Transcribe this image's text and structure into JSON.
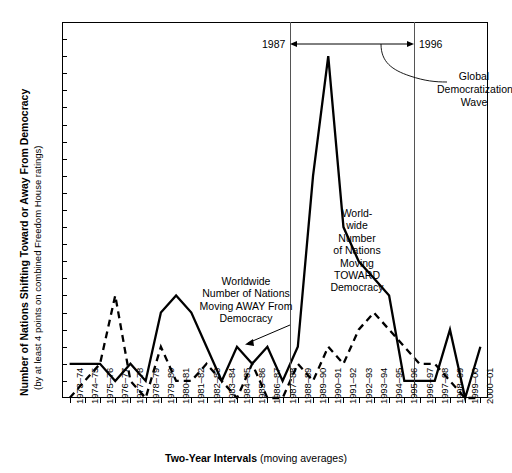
{
  "chart_data": {
    "type": "line",
    "title": "",
    "xlabel_bold": "Two-Year Intervals",
    "xlabel_rest": " (moving averages)",
    "ylabel_line1": "Number of Nations Shifting Toward or Away From Democracy",
    "ylabel_line2": "(by at least 4 points on combined Freedom House ratings)",
    "ylim": [
      0,
      22
    ],
    "yticks": [
      0,
      1,
      2,
      3,
      4,
      5,
      6,
      7,
      8,
      9,
      10,
      11,
      12,
      13,
      14,
      15,
      16,
      17,
      18,
      19,
      20,
      21,
      22
    ],
    "grid": false,
    "legend_position": "inline-annotations",
    "categories": [
      "1973–74",
      "1974–75",
      "1975–76",
      "1976–77",
      "1977–78",
      "1978–79",
      "1979–80",
      "1980–81",
      "1981–82",
      "1982–83",
      "1983–84",
      "1984–85",
      "1985–86",
      "1986–87",
      "1987–88",
      "1988–89",
      "1989–90",
      "1990–91",
      "1991–92",
      "1992–93",
      "1993–94",
      "1994–95",
      "1995–96",
      "1996–97",
      "1997–98",
      "1998–99",
      "1999–00",
      "2000–01"
    ],
    "series": [
      {
        "name": "Worldwide Number of Nations Moving TOWARD Democracy",
        "style": "solid",
        "values": [
          2,
          2,
          2,
          1,
          2,
          1,
          5,
          6,
          5,
          3,
          1,
          3,
          2,
          3,
          1,
          3,
          13,
          20,
          10,
          8,
          7,
          6,
          1,
          1,
          1,
          4,
          0,
          3
        ]
      },
      {
        "name": "Worldwide Number of Nations Moving AWAY From Democracy",
        "style": "dashed",
        "values": [
          0,
          1,
          2,
          6,
          1,
          0,
          3,
          1,
          1,
          2,
          1,
          0,
          2,
          0,
          0,
          2,
          1,
          3,
          2,
          4,
          5,
          4,
          3,
          2,
          2,
          1,
          0,
          0
        ]
      }
    ],
    "annotations": [
      {
        "id": "away-label",
        "text": "Worldwide\nNumber of Nations\nMoving AWAY From\nDemocracy"
      },
      {
        "id": "toward-label",
        "text": "World-\nwide\nNumber\nof Nations\nMoving\nTOWARD\nDemocracy"
      },
      {
        "id": "wave-label",
        "text": "Global\nDemocratization\nWave"
      },
      {
        "id": "year-start",
        "text": "1987"
      },
      {
        "id": "year-end",
        "text": "1996"
      }
    ],
    "markers": {
      "vertical_line_left_year": "1987",
      "vertical_line_right_year": "1996"
    },
    "colors": {
      "line": "#000000",
      "frame": "#000000",
      "marker_line": "#555555",
      "background": "#ffffff"
    }
  }
}
